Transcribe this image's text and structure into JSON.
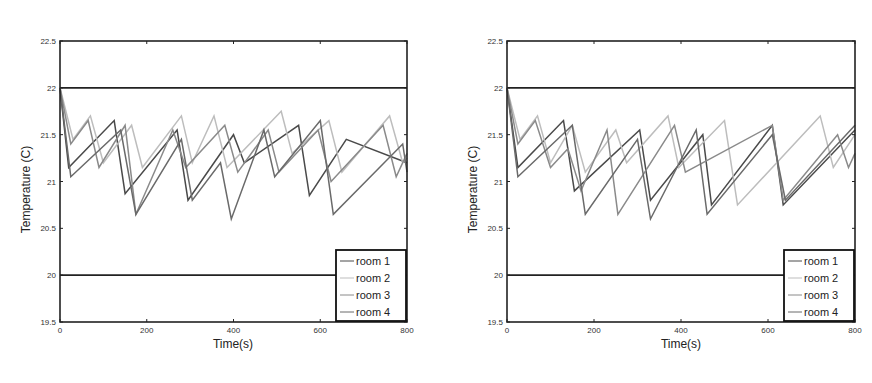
{
  "chart_data": [
    {
      "type": "line",
      "title": "",
      "xlabel": "Time(s)",
      "ylabel": "Temperature (C)",
      "xlim": [
        0,
        800
      ],
      "ylim": [
        19.5,
        22.5
      ],
      "xticks": [
        0,
        200,
        400,
        600,
        800
      ],
      "yticks": [
        19.5,
        20,
        20.5,
        21,
        21.5,
        22,
        22.5
      ],
      "xtick_labels": [
        "0",
        "200",
        "400",
        "600",
        "800"
      ],
      "ytick_labels": [
        "19.5",
        "20",
        "20.5",
        "21",
        "21.5",
        "22",
        "22.5"
      ],
      "grid": false,
      "legend_position": "lower right",
      "reference_lines": [
        {
          "name": "upper comfort bound",
          "y": 22,
          "color": "#222222"
        },
        {
          "name": "lower comfort bound",
          "y": 20,
          "color": "#222222"
        }
      ],
      "series": [
        {
          "name": "room 1",
          "color": "#4a4a4a",
          "x": [
            0,
            20,
            125,
            150,
            270,
            295,
            400,
            425,
            550,
            575,
            660,
            800
          ],
          "y": [
            22,
            21.15,
            21.65,
            20.87,
            21.55,
            20.8,
            21.5,
            21.2,
            21.6,
            20.85,
            21.45,
            21.2
          ]
        },
        {
          "name": "room 2",
          "color": "#bdbdbd",
          "x": [
            0,
            30,
            70,
            100,
            165,
            190,
            280,
            305,
            355,
            385,
            510,
            535,
            620,
            650,
            760,
            790,
            800
          ],
          "y": [
            22,
            21.45,
            21.7,
            21.2,
            21.6,
            21.15,
            21.7,
            21.2,
            21.7,
            21.15,
            21.75,
            21.3,
            21.65,
            21.1,
            21.7,
            21.2,
            21.25
          ]
        },
        {
          "name": "room 3",
          "color": "#8a8a8a",
          "x": [
            0,
            25,
            65,
            90,
            150,
            175,
            260,
            290,
            380,
            410,
            480,
            505,
            595,
            625,
            745,
            775,
            800
          ],
          "y": [
            22,
            21.4,
            21.65,
            21.15,
            21.6,
            20.65,
            21.55,
            21.15,
            21.6,
            21.1,
            21.55,
            21.1,
            21.55,
            21.0,
            21.6,
            21.05,
            21.3
          ]
        },
        {
          "name": "room 4",
          "color": "#6a6a6a",
          "x": [
            0,
            25,
            140,
            175,
            280,
            305,
            370,
            395,
            470,
            495,
            600,
            630,
            790,
            800
          ],
          "y": [
            22,
            21.05,
            21.55,
            20.65,
            21.45,
            20.8,
            21.2,
            20.6,
            21.55,
            21.05,
            21.65,
            20.65,
            21.4,
            21.1
          ]
        }
      ]
    },
    {
      "type": "line",
      "title": "",
      "xlabel": "Time(s)",
      "ylabel": "Temperature (C)",
      "xlim": [
        0,
        800
      ],
      "ylim": [
        19.5,
        22.5
      ],
      "xticks": [
        0,
        200,
        400,
        600,
        800
      ],
      "yticks": [
        19.5,
        20,
        20.5,
        21,
        21.5,
        22,
        22.5
      ],
      "xtick_labels": [
        "0",
        "200",
        "400",
        "600",
        "800"
      ],
      "ytick_labels": [
        "19.5",
        "20",
        "20.5",
        "21",
        "21.5",
        "22",
        "22.5"
      ],
      "grid": false,
      "legend_position": "lower right",
      "reference_lines": [
        {
          "name": "upper comfort bound",
          "y": 22,
          "color": "#222222"
        },
        {
          "name": "lower comfort bound",
          "y": 20,
          "color": "#222222"
        }
      ],
      "series": [
        {
          "name": "room 1",
          "color": "#4a4a4a",
          "x": [
            0,
            25,
            130,
            155,
            305,
            330,
            450,
            470,
            610,
            635,
            800
          ],
          "y": [
            22,
            21.15,
            21.65,
            20.9,
            21.55,
            20.8,
            21.5,
            20.75,
            21.6,
            20.75,
            21.55
          ]
        },
        {
          "name": "room 2",
          "color": "#bdbdbd",
          "x": [
            0,
            30,
            70,
            100,
            150,
            180,
            250,
            275,
            370,
            395,
            500,
            530,
            720,
            750,
            800
          ],
          "y": [
            22,
            21.45,
            21.7,
            21.2,
            21.6,
            21.1,
            21.55,
            21.2,
            21.7,
            21.15,
            21.65,
            20.75,
            21.7,
            21.15,
            21.5
          ]
        },
        {
          "name": "room 3",
          "color": "#8a8a8a",
          "x": [
            0,
            25,
            65,
            100,
            140,
            170,
            230,
            255,
            385,
            410,
            610,
            635,
            760,
            785,
            800
          ],
          "y": [
            22,
            21.4,
            21.65,
            21.15,
            21.35,
            20.9,
            21.55,
            20.65,
            21.6,
            21.1,
            21.6,
            20.8,
            21.5,
            21.15,
            21.3
          ]
        },
        {
          "name": "room 4",
          "color": "#6a6a6a",
          "x": [
            0,
            25,
            150,
            180,
            300,
            330,
            435,
            460,
            610,
            640,
            800
          ],
          "y": [
            22,
            21.05,
            21.6,
            20.65,
            21.45,
            20.6,
            21.55,
            20.65,
            21.5,
            20.8,
            21.6
          ]
        }
      ]
    }
  ],
  "charts": [
    {
      "xlabel": "Time(s)",
      "ylabel": "Temperature (C)",
      "legend": [
        "room 1",
        "room 2",
        "room 3",
        "room 4"
      ]
    },
    {
      "xlabel": "Time(s)",
      "ylabel": "Temperature (C)",
      "legend": [
        "room 1",
        "room 2",
        "room 3",
        "room 4"
      ]
    }
  ]
}
